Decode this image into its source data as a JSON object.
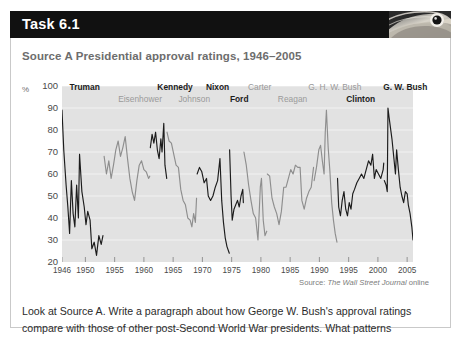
{
  "task": {
    "title": "Task 6.1",
    "icon": "eagle-head-photo",
    "body_text": "Look at Source A. Write a paragraph about how George W. Bush's approval ratings compare with those of other post-Second World War presidents. What patterns"
  },
  "source": {
    "heading": "Source A  Presidential approval ratings, 1946–2005",
    "attribution_prefix": "Source: ",
    "attribution_italic": "The Wall Street Journal",
    "attribution_suffix": " online"
  },
  "colors": {
    "header_bg": "#111111",
    "header_text": "#ffffff",
    "plot_bg": "#e2e2e2",
    "gridline": "#f2f2f2",
    "line_dark": "#1c1c1c",
    "line_light": "#8e8e8e",
    "heading_text": "#6d6d6d",
    "body_text": "#2b2b2b",
    "border": "#c9c9c9"
  },
  "chart_data": {
    "type": "line",
    "title": "Presidential approval ratings, 1946–2005",
    "xlabel": "",
    "ylabel": "%",
    "ylim": [
      20,
      100
    ],
    "xlim": [
      1946,
      2006
    ],
    "grid": true,
    "legend": "inline-president-labels",
    "y_ticks": [
      100,
      90,
      80,
      70,
      60,
      50,
      40,
      30,
      20
    ],
    "x_ticks": [
      1946,
      1950,
      1955,
      1960,
      1965,
      1970,
      1975,
      1980,
      1985,
      1990,
      1995,
      2000,
      2005
    ],
    "presidents": [
      {
        "name": "Truman",
        "row": "top",
        "style": "dark",
        "start": 1946.0,
        "end": 1953.0,
        "label_x": 1947.3
      },
      {
        "name": "Eisenhower",
        "row": "bottom",
        "style": "light",
        "start": 1953.0,
        "end": 1961.0,
        "label_x": 1955.6
      },
      {
        "name": "Kennedy",
        "row": "top",
        "style": "dark",
        "start": 1961.0,
        "end": 1963.9,
        "label_x": 1962.3
      },
      {
        "name": "Johnson",
        "row": "bottom",
        "style": "light",
        "start": 1963.9,
        "end": 1969.0,
        "label_x": 1965.9
      },
      {
        "name": "Nixon",
        "row": "top",
        "style": "dark",
        "start": 1969.0,
        "end": 1974.6,
        "label_x": 1970.6
      },
      {
        "name": "Ford",
        "row": "bottom",
        "style": "dark",
        "start": 1974.6,
        "end": 1977.0,
        "label_x": 1974.7
      },
      {
        "name": "Carter",
        "row": "top",
        "style": "light",
        "start": 1977.0,
        "end": 1981.0,
        "label_x": 1977.8
      },
      {
        "name": "Reagan",
        "row": "bottom",
        "style": "light",
        "start": 1981.0,
        "end": 1989.0,
        "label_x": 1982.9
      },
      {
        "name": "G. H. W. Bush",
        "row": "top",
        "style": "light",
        "start": 1989.0,
        "end": 1993.0,
        "label_x": 1988.1
      },
      {
        "name": "Clinton",
        "row": "bottom",
        "style": "dark",
        "start": 1993.0,
        "end": 2001.0,
        "label_x": 1994.6
      },
      {
        "name": "G. W. Bush",
        "row": "top",
        "style": "dark",
        "start": 2001.0,
        "end": 2006.0,
        "label_x": 2000.9
      }
    ],
    "series": [
      {
        "name": "Truman",
        "style": "dark",
        "points": [
          [
            1946.0,
            89
          ],
          [
            1946.3,
            71
          ],
          [
            1946.7,
            55
          ],
          [
            1947.0,
            45
          ],
          [
            1947.3,
            33
          ],
          [
            1947.6,
            57
          ],
          [
            1947.9,
            42
          ],
          [
            1948.2,
            36
          ],
          [
            1948.5,
            55
          ],
          [
            1948.8,
            40
          ],
          [
            1949.0,
            69
          ],
          [
            1949.4,
            52
          ],
          [
            1949.8,
            45
          ],
          [
            1950.1,
            37
          ],
          [
            1950.4,
            43
          ],
          [
            1950.8,
            39
          ],
          [
            1951.1,
            26
          ],
          [
            1951.5,
            29
          ],
          [
            1951.9,
            23
          ],
          [
            1952.3,
            32
          ],
          [
            1952.7,
            28
          ],
          [
            1953.0,
            32
          ]
        ]
      },
      {
        "name": "Eisenhower",
        "style": "light",
        "points": [
          [
            1953.2,
            68
          ],
          [
            1953.6,
            60
          ],
          [
            1954.0,
            66
          ],
          [
            1954.4,
            58
          ],
          [
            1954.8,
            64
          ],
          [
            1955.2,
            71
          ],
          [
            1955.6,
            75
          ],
          [
            1956.0,
            68
          ],
          [
            1956.4,
            72
          ],
          [
            1956.8,
            77
          ],
          [
            1957.2,
            67
          ],
          [
            1957.6,
            58
          ],
          [
            1958.0,
            52
          ],
          [
            1958.4,
            48
          ],
          [
            1958.8,
            57
          ],
          [
            1959.2,
            64
          ],
          [
            1959.6,
            66
          ],
          [
            1960.0,
            62
          ],
          [
            1960.4,
            61
          ],
          [
            1960.8,
            58
          ],
          [
            1961.0,
            59
          ]
        ]
      },
      {
        "name": "Kennedy",
        "style": "dark",
        "points": [
          [
            1961.1,
            72
          ],
          [
            1961.4,
            78
          ],
          [
            1961.7,
            74
          ],
          [
            1962.0,
            79
          ],
          [
            1962.3,
            71
          ],
          [
            1962.6,
            67
          ],
          [
            1962.9,
            76
          ],
          [
            1963.1,
            70
          ],
          [
            1963.4,
            83
          ],
          [
            1963.6,
            64
          ],
          [
            1963.9,
            58
          ]
        ]
      },
      {
        "name": "Johnson",
        "style": "light",
        "points": [
          [
            1963.95,
            79
          ],
          [
            1964.3,
            75
          ],
          [
            1964.7,
            74
          ],
          [
            1965.1,
            69
          ],
          [
            1965.5,
            64
          ],
          [
            1965.9,
            63
          ],
          [
            1966.3,
            53
          ],
          [
            1966.7,
            48
          ],
          [
            1967.1,
            46
          ],
          [
            1967.5,
            40
          ],
          [
            1967.9,
            39
          ],
          [
            1968.2,
            36
          ],
          [
            1968.5,
            42
          ],
          [
            1968.8,
            38
          ],
          [
            1969.0,
            49
          ]
        ]
      },
      {
        "name": "Nixon",
        "style": "dark",
        "points": [
          [
            1969.1,
            60
          ],
          [
            1969.5,
            63
          ],
          [
            1969.9,
            61
          ],
          [
            1970.3,
            56
          ],
          [
            1970.7,
            58
          ],
          [
            1971.0,
            50
          ],
          [
            1971.4,
            48
          ],
          [
            1971.8,
            50
          ],
          [
            1972.2,
            54
          ],
          [
            1972.6,
            57
          ],
          [
            1973.0,
            67
          ],
          [
            1973.3,
            48
          ],
          [
            1973.6,
            38
          ],
          [
            1973.9,
            31
          ],
          [
            1974.2,
            27
          ],
          [
            1974.6,
            24
          ]
        ]
      },
      {
        "name": "Ford",
        "style": "dark",
        "points": [
          [
            1974.65,
            71
          ],
          [
            1974.9,
            50
          ],
          [
            1975.1,
            39
          ],
          [
            1975.4,
            44
          ],
          [
            1975.7,
            46
          ],
          [
            1976.0,
            48
          ],
          [
            1976.3,
            45
          ],
          [
            1976.6,
            50
          ],
          [
            1976.9,
            53
          ],
          [
            1977.0,
            47
          ]
        ]
      },
      {
        "name": "Carter",
        "style": "light",
        "points": [
          [
            1977.1,
            70
          ],
          [
            1977.5,
            64
          ],
          [
            1977.9,
            55
          ],
          [
            1978.3,
            48
          ],
          [
            1978.7,
            42
          ],
          [
            1979.1,
            40
          ],
          [
            1979.5,
            30
          ],
          [
            1979.9,
            54
          ],
          [
            1980.1,
            58
          ],
          [
            1980.4,
            39
          ],
          [
            1980.7,
            32
          ],
          [
            1981.0,
            34
          ]
        ]
      },
      {
        "name": "Reagan",
        "style": "light",
        "points": [
          [
            1981.1,
            60
          ],
          [
            1981.5,
            59
          ],
          [
            1981.9,
            49
          ],
          [
            1982.3,
            45
          ],
          [
            1982.7,
            42
          ],
          [
            1983.1,
            37
          ],
          [
            1983.5,
            43
          ],
          [
            1983.9,
            54
          ],
          [
            1984.3,
            54
          ],
          [
            1984.7,
            58
          ],
          [
            1985.1,
            62
          ],
          [
            1985.5,
            60
          ],
          [
            1985.9,
            64
          ],
          [
            1986.3,
            63
          ],
          [
            1986.7,
            63
          ],
          [
            1987.0,
            48
          ],
          [
            1987.4,
            44
          ],
          [
            1987.8,
            49
          ],
          [
            1988.2,
            52
          ],
          [
            1988.6,
            54
          ],
          [
            1989.0,
            63
          ]
        ]
      },
      {
        "name": "G. H. W. Bush",
        "style": "light",
        "points": [
          [
            1989.1,
            57
          ],
          [
            1989.5,
            63
          ],
          [
            1989.9,
            71
          ],
          [
            1990.2,
            73
          ],
          [
            1990.5,
            66
          ],
          [
            1990.8,
            60
          ],
          [
            1991.0,
            79
          ],
          [
            1991.2,
            89
          ],
          [
            1991.5,
            72
          ],
          [
            1991.8,
            61
          ],
          [
            1992.1,
            47
          ],
          [
            1992.4,
            39
          ],
          [
            1992.7,
            33
          ],
          [
            1993.0,
            29
          ]
        ]
      },
      {
        "name": "Clinton",
        "style": "dark",
        "points": [
          [
            1993.1,
            58
          ],
          [
            1993.3,
            45
          ],
          [
            1993.6,
            41
          ],
          [
            1993.9,
            48
          ],
          [
            1994.2,
            52
          ],
          [
            1994.5,
            44
          ],
          [
            1994.8,
            41
          ],
          [
            1995.1,
            47
          ],
          [
            1995.4,
            44
          ],
          [
            1995.7,
            51
          ],
          [
            1996.0,
            53
          ],
          [
            1996.4,
            56
          ],
          [
            1996.8,
            58
          ],
          [
            1997.2,
            60
          ],
          [
            1997.6,
            58
          ],
          [
            1998.0,
            62
          ],
          [
            1998.4,
            66
          ],
          [
            1998.8,
            64
          ],
          [
            1999.1,
            69
          ],
          [
            1999.4,
            58
          ],
          [
            1999.7,
            62
          ],
          [
            2000.1,
            60
          ],
          [
            2000.5,
            58
          ],
          [
            2000.9,
            62
          ],
          [
            2001.0,
            65
          ]
        ]
      },
      {
        "name": "G. W. Bush",
        "style": "dark",
        "points": [
          [
            2001.1,
            57
          ],
          [
            2001.4,
            55
          ],
          [
            2001.6,
            52
          ],
          [
            2001.72,
            90
          ],
          [
            2001.9,
            86
          ],
          [
            2002.1,
            82
          ],
          [
            2002.4,
            76
          ],
          [
            2002.7,
            68
          ],
          [
            2003.0,
            60
          ],
          [
            2003.2,
            71
          ],
          [
            2003.5,
            62
          ],
          [
            2003.8,
            54
          ],
          [
            2004.1,
            50
          ],
          [
            2004.4,
            47
          ],
          [
            2004.7,
            52
          ],
          [
            2005.0,
            51
          ],
          [
            2005.2,
            46
          ],
          [
            2005.5,
            42
          ],
          [
            2005.8,
            36
          ],
          [
            2006.0,
            30
          ]
        ]
      }
    ]
  }
}
